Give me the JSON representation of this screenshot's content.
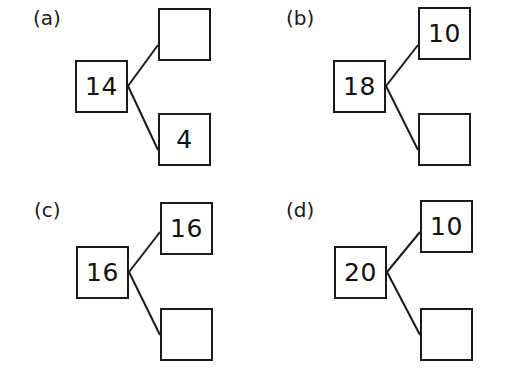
{
  "document": {
    "type": "math-worksheet",
    "title": "Number bond diagrams",
    "background_color": "#ffffff",
    "ink_color": "#1a1a1a"
  },
  "panels": [
    {
      "id": "a",
      "label": "(a)",
      "parent": {
        "value": "14",
        "empty": false
      },
      "child_top": {
        "value": "",
        "empty": true
      },
      "child_bottom": {
        "value": "4",
        "empty": false
      }
    },
    {
      "id": "b",
      "label": "(b)",
      "parent": {
        "value": "18",
        "empty": false
      },
      "child_top": {
        "value": "10",
        "empty": false
      },
      "child_bottom": {
        "value": "",
        "empty": true
      }
    },
    {
      "id": "c",
      "label": "(c)",
      "parent": {
        "value": "16",
        "empty": false
      },
      "child_top": {
        "value": "16",
        "empty": false
      },
      "child_bottom": {
        "value": "",
        "empty": true
      }
    },
    {
      "id": "d",
      "label": "(d)",
      "parent": {
        "value": "20",
        "empty": false
      },
      "child_top": {
        "value": "10",
        "empty": false
      },
      "child_bottom": {
        "value": "",
        "empty": true
      }
    }
  ]
}
